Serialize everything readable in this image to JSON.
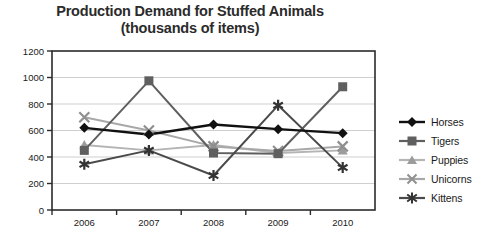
{
  "chart_data": {
    "type": "line",
    "title": "Production Demand for Stuffed Animals",
    "subtitle": "(thousands of items)",
    "title_full": "Production Demand for Stuffed Animals (thousands of items)",
    "xlabel": "",
    "ylabel": "",
    "categories": [
      "2006",
      "2007",
      "2008",
      "2009",
      "2010"
    ],
    "ylim": [
      0,
      1200
    ],
    "yticks": [
      0,
      200,
      400,
      600,
      800,
      1000,
      1200
    ],
    "ytick_labels": [
      "0",
      "200",
      "400",
      "600",
      "800",
      "1000",
      "1200"
    ],
    "grid": true,
    "grid_axis": "y",
    "legend_position": "right",
    "series": [
      {
        "name": "Horses",
        "marker": "diamond",
        "color": "#111111",
        "line_width": 2.4,
        "values": [
          620,
          570,
          645,
          610,
          580
        ]
      },
      {
        "name": "Tigers",
        "marker": "square",
        "color": "#5f5f5f",
        "line_width": 2.0,
        "values": [
          450,
          975,
          430,
          425,
          930
        ]
      },
      {
        "name": "Puppies",
        "marker": "triangle",
        "color": "#b4b4b4",
        "line_width": 2.0,
        "values": [
          490,
          450,
          490,
          430,
          450
        ]
      },
      {
        "name": "Unicorns",
        "marker": "x",
        "color": "#a8a8a8",
        "line_width": 2.0,
        "values": [
          700,
          600,
          480,
          445,
          480
        ]
      },
      {
        "name": "Kittens",
        "marker": "asterisk",
        "color": "#4a4a4a",
        "line_width": 2.0,
        "values": [
          345,
          450,
          260,
          790,
          320
        ]
      }
    ]
  },
  "legend": {
    "items": [
      {
        "label": "Horses",
        "marker_name": "diamond-marker-icon"
      },
      {
        "label": "Tigers",
        "marker_name": "square-marker-icon"
      },
      {
        "label": "Puppies",
        "marker_name": "triangle-marker-icon"
      },
      {
        "label": "Unicorns",
        "marker_name": "x-marker-icon"
      },
      {
        "label": "Kittens",
        "marker_name": "asterisk-marker-icon"
      }
    ]
  },
  "colors": {
    "axis": "#2b2b2b",
    "grid": "#cfcfcf",
    "text": "#1a1a1a",
    "background": "#ffffff"
  }
}
